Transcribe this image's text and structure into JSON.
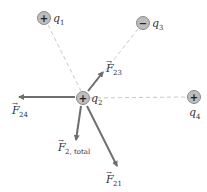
{
  "diagram": {
    "colors": {
      "arrow": "#6e6e6e",
      "dashed_line": "#c8c8c8",
      "charge_fill": "#bdbdbd",
      "charge_stroke": "#8a8a8a",
      "text": "#333333"
    },
    "charges": [
      {
        "id": "q1",
        "name": "q",
        "sub": "1",
        "sign": "+",
        "x": 44,
        "y": 18
      },
      {
        "id": "q2",
        "name": "q",
        "sub": "2",
        "sign": "+",
        "x": 83,
        "y": 98
      },
      {
        "id": "q3",
        "name": "q",
        "sub": "3",
        "sign": "−",
        "x": 143,
        "y": 23
      },
      {
        "id": "q4",
        "name": "q",
        "sub": "4",
        "sign": "+",
        "x": 194,
        "y": 97
      }
    ],
    "forces": [
      {
        "id": "F23",
        "name": "F",
        "sub": "23"
      },
      {
        "id": "F24",
        "name": "F",
        "sub": "24"
      },
      {
        "id": "F2total",
        "name": "F",
        "sub": "2, total"
      },
      {
        "id": "F21",
        "name": "F",
        "sub": "21"
      }
    ]
  }
}
